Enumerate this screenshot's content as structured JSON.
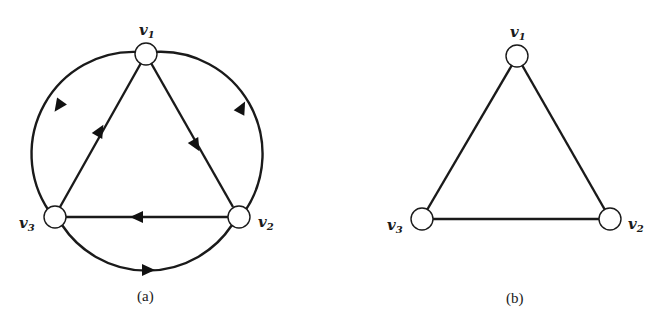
{
  "figure": {
    "colors": {
      "stroke": "#1a1a1a",
      "node_fill": "#ffffff",
      "background": "#ffffff"
    },
    "panels": [
      {
        "caption": "(a)",
        "type": "directed",
        "nodes": [
          {
            "id": "v1",
            "label": "v",
            "sub": "1",
            "x": 146,
            "y": 54
          },
          {
            "id": "v2",
            "label": "v",
            "sub": "2",
            "x": 239,
            "y": 217
          },
          {
            "id": "v3",
            "label": "v",
            "sub": "3",
            "x": 55,
            "y": 217
          }
        ],
        "edges": [
          {
            "from": "v1",
            "to": "v2",
            "shape": "straight"
          },
          {
            "from": "v2",
            "to": "v3",
            "shape": "straight"
          },
          {
            "from": "v3",
            "to": "v1",
            "shape": "straight"
          },
          {
            "from": "v1",
            "to": "v3",
            "shape": "arc"
          },
          {
            "from": "v2",
            "to": "v1",
            "shape": "arc"
          },
          {
            "from": "v3",
            "to": "v2",
            "shape": "arc"
          }
        ]
      },
      {
        "caption": "(b)",
        "type": "undirected",
        "nodes": [
          {
            "id": "v1",
            "label": "v",
            "sub": "1",
            "x": 517,
            "y": 56
          },
          {
            "id": "v2",
            "label": "v",
            "sub": "2",
            "x": 610,
            "y": 219
          },
          {
            "id": "v3",
            "label": "v",
            "sub": "3",
            "x": 422,
            "y": 219
          }
        ],
        "edges": [
          {
            "from": "v1",
            "to": "v2",
            "shape": "straight"
          },
          {
            "from": "v2",
            "to": "v3",
            "shape": "straight"
          },
          {
            "from": "v3",
            "to": "v1",
            "shape": "straight"
          }
        ]
      }
    ],
    "labels": {
      "a": {
        "v1": "v",
        "v1_sub": "1",
        "v2": "v",
        "v2_sub": "2",
        "v3": "v",
        "v3_sub": "3",
        "caption": "(a)"
      },
      "b": {
        "v1": "v",
        "v1_sub": "1",
        "v2": "v",
        "v2_sub": "2",
        "v3": "v",
        "v3_sub": "3",
        "caption": "(b)"
      }
    }
  }
}
